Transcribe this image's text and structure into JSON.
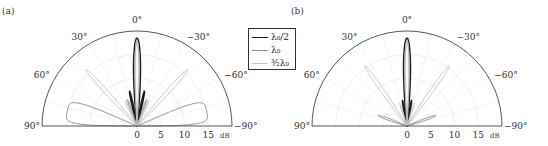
{
  "chart_data": [
    {
      "type": "polar",
      "panel_label": "(a)",
      "angle_range_deg": [
        -90,
        90
      ],
      "angle_ticks": [
        {
          "deg": 90,
          "label": "90°"
        },
        {
          "deg": 60,
          "label": "60°"
        },
        {
          "deg": 30,
          "label": "30°"
        },
        {
          "deg": 0,
          "label": "0°"
        },
        {
          "deg": -30,
          "label": "−30°"
        },
        {
          "deg": -60,
          "label": "−60°"
        },
        {
          "deg": -90,
          "label": "−90°"
        }
      ],
      "radial_ticks": [
        "0",
        "5",
        "10",
        "15"
      ],
      "radial_unit": "dB",
      "radial_range": [
        0,
        20
      ],
      "grid": true,
      "series": [
        {
          "name": "λ0/2",
          "color": "#1a1a1a",
          "width": 1.4,
          "lobes": [
            {
              "deg": 0,
              "r": 18.5,
              "w": 4
            },
            {
              "deg": 12,
              "r": 7.5,
              "w": 2
            },
            {
              "deg": -12,
              "r": 7.5,
              "w": 2
            }
          ]
        },
        {
          "name": "λ0",
          "color": "#8c8c8c",
          "width": 0.9,
          "lobes": [
            {
              "deg": 0,
              "r": 18,
              "w": 2.5
            },
            {
              "deg": 78,
              "r": 15,
              "w": 12,
              "flat": true
            },
            {
              "deg": -78,
              "r": 15,
              "w": 12,
              "flat": true
            },
            {
              "deg": 20,
              "r": 6,
              "w": 2
            },
            {
              "deg": -20,
              "r": 6,
              "w": 2
            }
          ]
        },
        {
          "name": "3/2 λ0",
          "color": "#c4c4c4",
          "width": 0.9,
          "lobes": [
            {
              "deg": 0,
              "r": 18,
              "w": 2
            },
            {
              "deg": 42,
              "r": 16,
              "w": 2.5
            },
            {
              "deg": -42,
              "r": 16,
              "w": 2.5
            },
            {
              "deg": 25,
              "r": 6,
              "w": 2
            },
            {
              "deg": -25,
              "r": 6,
              "w": 2
            }
          ]
        }
      ]
    },
    {
      "type": "polar",
      "panel_label": "(b)",
      "angle_range_deg": [
        -90,
        90
      ],
      "angle_ticks": [
        {
          "deg": 90,
          "label": "90°"
        },
        {
          "deg": 60,
          "label": "60°"
        },
        {
          "deg": 30,
          "label": "30°"
        },
        {
          "deg": 0,
          "label": "0°"
        },
        {
          "deg": -30,
          "label": "−30°"
        },
        {
          "deg": -60,
          "label": "−60°"
        },
        {
          "deg": -90,
          "label": "−90°"
        }
      ],
      "radial_ticks": [
        "0",
        "5",
        "10",
        "15"
      ],
      "radial_unit": "dB",
      "radial_range": [
        0,
        20
      ],
      "grid": true,
      "series": [
        {
          "name": "λ0/2",
          "color": "#1a1a1a",
          "width": 1.4,
          "lobes": [
            {
              "deg": 0,
              "r": 18.5,
              "w": 4
            },
            {
              "deg": 10,
              "r": 5.5,
              "w": 2
            },
            {
              "deg": -10,
              "r": 5.5,
              "w": 2
            }
          ]
        },
        {
          "name": "λ0",
          "color": "#8c8c8c",
          "width": 0.9,
          "lobes": [
            {
              "deg": 0,
              "r": 18,
              "w": 2.5
            },
            {
              "deg": 70,
              "r": 6.5,
              "w": 3
            },
            {
              "deg": -70,
              "r": 6.5,
              "w": 3
            }
          ]
        },
        {
          "name": "3/2 λ0",
          "color": "#c4c4c4",
          "width": 0.9,
          "lobes": [
            {
              "deg": 0,
              "r": 18,
              "w": 2
            },
            {
              "deg": 35,
              "r": 15.5,
              "w": 2.5
            },
            {
              "deg": -35,
              "r": 15.5,
              "w": 2.5
            },
            {
              "deg": 18,
              "r": 5,
              "w": 2
            },
            {
              "deg": -18,
              "r": 5,
              "w": 2
            }
          ]
        }
      ]
    }
  ],
  "legend": {
    "entries": [
      {
        "label": "λ₀/2",
        "color": "#1a1a1a",
        "width": 1.5
      },
      {
        "label": "λ₀",
        "color": "#8c8c8c",
        "width": 1
      },
      {
        "label": "³⁄₂λ₀",
        "color": "#c4c4c4",
        "width": 1
      }
    ]
  }
}
